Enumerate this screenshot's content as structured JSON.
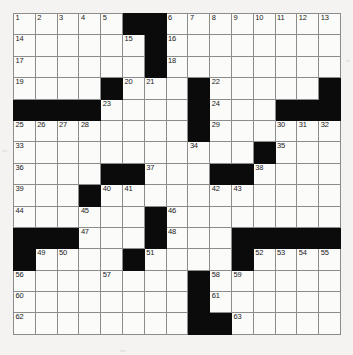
{
  "puzzle": {
    "type": "crossword-grid",
    "rows": 15,
    "cols": 15,
    "cell_colors": {
      "open": "#fbfbf9",
      "block": "#0b0b0b",
      "grid_line": "#8c8c8c",
      "outer_border": "#4a4a4a",
      "page_background": "#f4f3f1",
      "number_text": "#1a1a1a"
    },
    "max_clue_number": 63,
    "grid": [
      [
        {
          "n": "1"
        },
        {
          "n": "2"
        },
        {
          "n": "3"
        },
        {
          "n": "4"
        },
        {
          "n": "5"
        },
        {
          "block": true
        },
        {
          "block": true
        },
        {
          "n": "6"
        },
        {
          "n": "7"
        },
        {
          "n": "8"
        },
        {
          "n": "9"
        },
        {
          "n": "10"
        },
        {
          "n": "11"
        },
        {
          "n": "12"
        },
        {
          "n": "13"
        }
      ],
      [
        {
          "n": "14"
        },
        {},
        {},
        {},
        {},
        {
          "n": "15"
        },
        {
          "block": true
        },
        {
          "n": "16"
        },
        {},
        {},
        {},
        {},
        {},
        {},
        {}
      ],
      [
        {
          "n": "17"
        },
        {},
        {},
        {},
        {},
        {},
        {
          "block": true
        },
        {
          "n": "18"
        },
        {},
        {},
        {},
        {},
        {},
        {},
        {}
      ],
      [
        {
          "n": "19"
        },
        {},
        {},
        {},
        {
          "block": true
        },
        {
          "n": "20"
        },
        {
          "n": "21"
        },
        {},
        {
          "block": true
        },
        {
          "n": "22"
        },
        {},
        {},
        {},
        {},
        {
          "block": true
        }
      ],
      [
        {
          "block": true
        },
        {
          "block": true
        },
        {
          "block": true
        },
        {
          "block": true
        },
        {
          "n": "23"
        },
        {},
        {},
        {},
        {
          "block": true
        },
        {
          "n": "24"
        },
        {},
        {},
        {
          "block": true
        },
        {
          "block": true
        },
        {
          "block": true
        }
      ],
      [
        {
          "n": "25"
        },
        {
          "n": "26"
        },
        {
          "n": "27"
        },
        {
          "n": "28"
        },
        {},
        {},
        {},
        {},
        {
          "block": true
        },
        {
          "n": "29"
        },
        {},
        {},
        {
          "n": "30"
        },
        {
          "n": "31"
        },
        {
          "n": "32"
        }
      ],
      [
        {
          "n": "33"
        },
        {},
        {},
        {},
        {},
        {},
        {},
        {},
        {
          "n": "34"
        },
        {},
        {},
        {
          "block": true
        },
        {
          "n": "35"
        },
        {},
        {}
      ],
      [
        {
          "n": "36"
        },
        {},
        {},
        {},
        {
          "block": true
        },
        {
          "block": true
        },
        {
          "n": "37"
        },
        {},
        {},
        {
          "block": true
        },
        {
          "block": true
        },
        {
          "n": "38"
        },
        {},
        {},
        {}
      ],
      [
        {
          "n": "39"
        },
        {},
        {},
        {
          "block": true
        },
        {
          "n": "40"
        },
        {
          "n": "41"
        },
        {},
        {},
        {},
        {
          "n": "42"
        },
        {
          "n": "43"
        },
        {},
        {},
        {},
        {}
      ],
      [
        {
          "n": "44"
        },
        {},
        {},
        {
          "n": "45"
        },
        {},
        {},
        {
          "block": true
        },
        {
          "n": "46"
        },
        {},
        {},
        {},
        {},
        {},
        {},
        {}
      ],
      [
        {
          "block": true
        },
        {
          "block": true
        },
        {
          "block": true
        },
        {
          "n": "47"
        },
        {},
        {},
        {
          "block": true
        },
        {
          "n": "48"
        },
        {},
        {},
        {
          "block": true
        },
        {
          "block": true
        },
        {
          "block": true
        },
        {
          "block": true
        },
        {
          "block": true
        }
      ],
      [
        {
          "block": true
        },
        {
          "n": "49"
        },
        {
          "n": "50"
        },
        {},
        {},
        {
          "block": true
        },
        {
          "n": "51"
        },
        {},
        {},
        {},
        {
          "block": true
        },
        {
          "n": "52"
        },
        {
          "n": "53"
        },
        {
          "n": "54"
        },
        {
          "n": "55"
        }
      ],
      [
        {
          "n": "56"
        },
        {},
        {},
        {},
        {
          "n": "57"
        },
        {},
        {},
        {},
        {
          "block": true
        },
        {
          "n": "58"
        },
        {
          "n": "59"
        },
        {},
        {},
        {},
        {}
      ],
      [
        {
          "n": "60"
        },
        {},
        {},
        {},
        {},
        {},
        {},
        {},
        {
          "block": true
        },
        {
          "n": "61"
        },
        {},
        {},
        {},
        {},
        {}
      ],
      [
        {
          "n": "62"
        },
        {},
        {},
        {},
        {},
        {},
        {},
        {},
        {
          "block": true
        },
        {
          "block": true
        },
        {
          "n": "63"
        },
        {},
        {},
        {},
        {}
      ]
    ]
  }
}
